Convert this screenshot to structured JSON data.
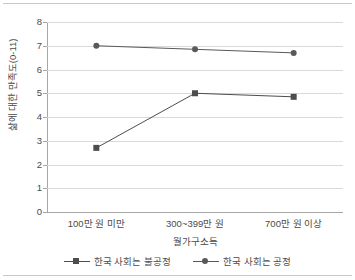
{
  "chart_data": {
    "type": "line",
    "title": "",
    "categories": [
      "100만 원 미만",
      "300~399만 원",
      "700만 원 이상"
    ],
    "series": [
      {
        "name": "한국 사회는 불공정",
        "marker": "square",
        "color": "#4d4d4d",
        "values": [
          2.7,
          5.0,
          4.85
        ]
      },
      {
        "name": "한국 사회는 공정",
        "marker": "circle",
        "color": "#595959",
        "values": [
          7.0,
          6.85,
          6.7
        ]
      }
    ],
    "xlabel": "월가구소득",
    "ylabel": "삶에 대한 만족도(0-11)",
    "ylim": [
      0,
      8
    ],
    "yticks": [
      0,
      1,
      2,
      3,
      4,
      5,
      6,
      7,
      8
    ],
    "ytick_labels": [
      "0",
      "1",
      "2",
      "3",
      "4",
      "5",
      "6",
      "7",
      "8"
    ],
    "grid": true,
    "legend_position": "bottom"
  },
  "axis": {
    "y_title": "삶에 대한 만족도(0-11)",
    "x_title": "월가구소득"
  },
  "legend": {
    "items": [
      {
        "label": "한국 사회는 불공정"
      },
      {
        "label": "한국 사회는 공정"
      }
    ]
  }
}
